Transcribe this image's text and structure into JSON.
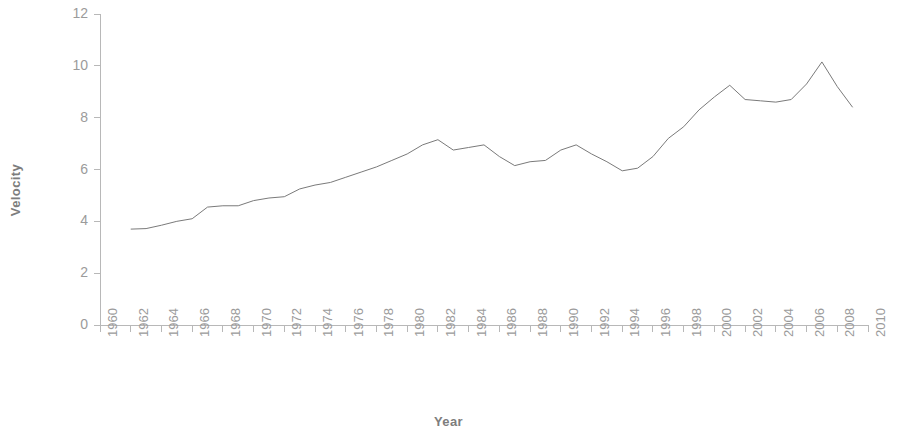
{
  "chart_data": {
    "type": "line",
    "title": "",
    "xlabel": "Year",
    "ylabel": "Velocity",
    "xlim": [
      1960,
      2010
    ],
    "ylim": [
      0,
      12
    ],
    "grid": false,
    "legend": "none",
    "x_tick_labels": [
      "1960",
      "1962",
      "1964",
      "1966",
      "1968",
      "1970",
      "1972",
      "1974",
      "1976",
      "1978",
      "1980",
      "1982",
      "1984",
      "1986",
      "1988",
      "1990",
      "1992",
      "1994",
      "1996",
      "1998",
      "2000",
      "2002",
      "2004",
      "2006",
      "2008",
      "2010"
    ],
    "y_tick_labels": [
      "0",
      "2",
      "4",
      "6",
      "8",
      "10",
      "12"
    ],
    "x_tick_step": 2,
    "y_tick_step": 2,
    "series": [
      {
        "name": "Velocity",
        "color": "#7a7a7a",
        "x": [
          1962,
          1963,
          1964,
          1965,
          1966,
          1967,
          1968,
          1969,
          1970,
          1971,
          1972,
          1973,
          1974,
          1975,
          1976,
          1977,
          1978,
          1979,
          1980,
          1981,
          1982,
          1983,
          1984,
          1985,
          1986,
          1987,
          1988,
          1989,
          1990,
          1991,
          1992,
          1993,
          1994,
          1995,
          1996,
          1997,
          1998,
          1999,
          2000,
          2001,
          2002,
          2003,
          2004,
          2005,
          2006,
          2007,
          2008,
          2009
        ],
        "y": [
          3.7,
          3.72,
          3.85,
          4.0,
          4.1,
          4.55,
          4.6,
          4.6,
          4.8,
          4.9,
          4.95,
          5.25,
          5.4,
          5.5,
          5.7,
          5.9,
          6.1,
          6.35,
          6.6,
          6.95,
          7.15,
          6.75,
          6.85,
          6.95,
          6.5,
          6.15,
          6.3,
          6.35,
          6.75,
          6.95,
          6.6,
          6.3,
          5.95,
          6.05,
          6.5,
          7.2,
          7.65,
          8.3,
          8.8,
          9.25,
          8.7,
          8.65,
          8.6,
          8.7,
          9.3,
          10.15,
          9.2,
          8.4
        ]
      }
    ]
  },
  "axes": {
    "y_title": "Velocity",
    "x_title": "Year"
  }
}
